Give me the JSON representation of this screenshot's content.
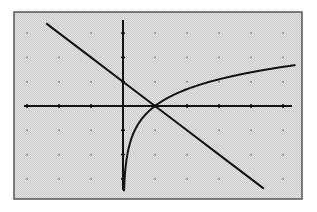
{
  "chart_data": {
    "type": "line",
    "title": "",
    "xlabel": "",
    "ylabel": "",
    "xlim": [
      -3,
      5.5
    ],
    "ylim": [
      -3.5,
      3.5
    ],
    "grid": "dots",
    "grid_step": {
      "x": 1,
      "y": 1
    },
    "legend": null,
    "series": [
      {
        "name": "y = -x + 1",
        "type": "linear",
        "x": [
          -2.4,
          -2,
          -1,
          0,
          1,
          2,
          3,
          4,
          4.4
        ],
        "y": [
          3.4,
          3,
          2,
          1,
          0,
          -1,
          -2,
          -3,
          -3.4
        ]
      },
      {
        "name": "y = ln(x)",
        "type": "logarithmic",
        "x": [
          0.03,
          0.05,
          0.1,
          0.25,
          0.5,
          1,
          2,
          3,
          4,
          5.4
        ],
        "y": [
          -3.5,
          -3.0,
          -2.3,
          -1.39,
          -0.69,
          0,
          0.69,
          1.1,
          1.39,
          1.69
        ]
      }
    ],
    "intersection": {
      "x": 1,
      "y": 0
    }
  },
  "colors": {
    "background": "#d9d9d9",
    "frame": "#555555",
    "axes": "#111111",
    "curve": "#111111",
    "grid_dot": "#777777"
  }
}
